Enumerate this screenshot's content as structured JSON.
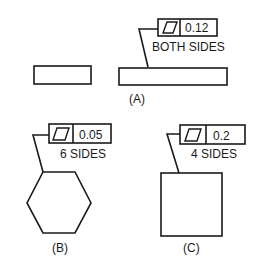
{
  "figure": {
    "type": "geometric-tolerancing-parallelism",
    "colors": {
      "ink": "#1a1a1a",
      "background": "#ffffff"
    },
    "panels": [
      {
        "id": "A",
        "label": "(A)",
        "feature_control_frame": {
          "symbol": "parallelogram-icon",
          "tolerance": "0.12",
          "note": "BOTH SIDES"
        },
        "shape": "thin-rectangle-pair"
      },
      {
        "id": "B",
        "label": "(B)",
        "feature_control_frame": {
          "symbol": "parallelogram-icon",
          "tolerance": "0.05",
          "note": "6 SIDES"
        },
        "shape": "hexagon"
      },
      {
        "id": "C",
        "label": "(C)",
        "feature_control_frame": {
          "symbol": "parallelogram-icon",
          "tolerance": "0.2",
          "note": "4 SIDES"
        },
        "shape": "square"
      }
    ]
  }
}
